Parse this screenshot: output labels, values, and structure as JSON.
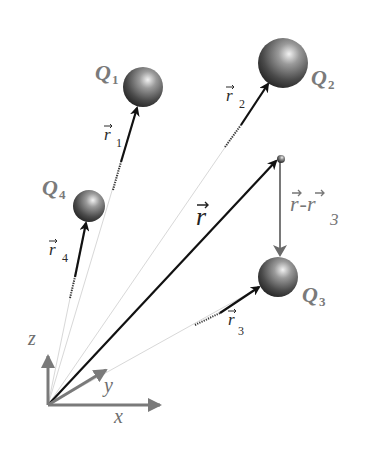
{
  "diagram": {
    "type": "vector-position-diagram",
    "origin": {
      "x": 48,
      "y": 405
    },
    "axes": {
      "x_label": "x",
      "y_label": "y",
      "z_label": "z",
      "color": "#7a7a7a"
    },
    "charges": [
      {
        "name": "Q",
        "sub": "1",
        "cx": 143,
        "cy": 87,
        "r": 20
      },
      {
        "name": "Q",
        "sub": "2",
        "cx": 283,
        "cy": 63,
        "r": 25
      },
      {
        "name": "Q",
        "sub": "3",
        "cx": 278,
        "cy": 277,
        "r": 20
      },
      {
        "name": "Q",
        "sub": "4",
        "cx": 89,
        "cy": 206,
        "r": 16
      }
    ],
    "vectors": [
      {
        "label": "r",
        "sub": "1"
      },
      {
        "label": "r",
        "sub": "2"
      },
      {
        "label": "r",
        "sub": "3"
      },
      {
        "label": "r",
        "sub": "4"
      }
    ],
    "field_point": {
      "label": "r",
      "x": 280,
      "y": 158
    },
    "difference_vector": {
      "left": "r",
      "dash": "-",
      "right": "r",
      "sub": "3"
    },
    "colors": {
      "vector": "#111111",
      "axis": "#7a7a7a",
      "guide": "#d6d6d6",
      "sphere_dark": "#2c2c2c",
      "sphere_light": "#e8e8e8",
      "label": "#7a7a7a"
    }
  }
}
